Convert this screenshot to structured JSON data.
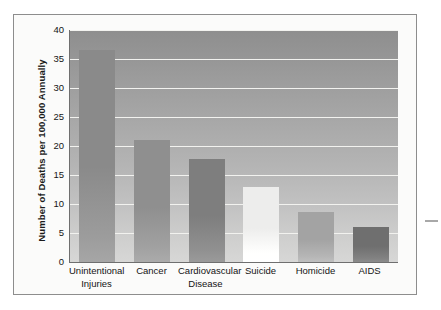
{
  "figure": {
    "caption": "",
    "edge_mark": "dash-mark"
  },
  "chart_data": {
    "type": "bar",
    "title": "",
    "xlabel": "",
    "ylabel": "Number of Deaths per 100,000 Annually",
    "ylim": [
      0,
      40
    ],
    "ytick_step": 5,
    "grid": true,
    "legend": "none",
    "categories": [
      "Unintentional Injuries",
      "Cancer",
      "Cardiovascular Disease",
      "Suicide",
      "Homicide",
      "AIDS"
    ],
    "category_lines": [
      [
        "Unintentional",
        "Injuries"
      ],
      [
        "Cancer",
        ""
      ],
      [
        "Cardiovascular",
        "Disease"
      ],
      [
        "Suicide",
        ""
      ],
      [
        "Homicide",
        ""
      ],
      [
        "AIDS",
        ""
      ]
    ],
    "values": [
      36.5,
      21,
      17.8,
      13,
      8.7,
      6
    ],
    "ytick_labels": [
      "40",
      "35",
      "30",
      "25",
      "20",
      "15",
      "10",
      "5",
      "0"
    ],
    "ytick_values": [
      40,
      35,
      30,
      25,
      20,
      15,
      10,
      5,
      0
    ],
    "bar_colors": [
      "#8a8a8a",
      "#8f8f8f",
      "#7e7e7e",
      "#ededec",
      "#a3a3a3",
      "#6f6f6f"
    ],
    "plot_bg_top": "#8e8e8e",
    "plot_bg_bottom": "#d7d7d6",
    "gridline_color": "#f2f2ef",
    "axis_color": "#6f6f6f",
    "frame_color": "#8d8d8d",
    "page_bg": "#fbfbfa"
  }
}
